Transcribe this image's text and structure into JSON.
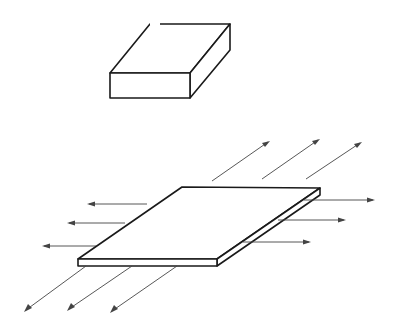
{
  "diagram": {
    "colors": {
      "line": "#1a1a1a",
      "arrow": "#444444",
      "background": "#ffffff"
    },
    "block": {
      "label": "thick-block",
      "front_face": [
        [
          110,
          73
        ],
        [
          190,
          73
        ],
        [
          190,
          98
        ],
        [
          110,
          98
        ]
      ],
      "top_face": [
        [
          110,
          73
        ],
        [
          150,
          24
        ],
        [
          230,
          24
        ],
        [
          190,
          73
        ]
      ],
      "side_face": [
        [
          190,
          73
        ],
        [
          230,
          24
        ],
        [
          230,
          50
        ],
        [
          190,
          98
        ]
      ]
    },
    "plate": {
      "label": "thin-plate",
      "top_face": [
        [
          78,
          259
        ],
        [
          182,
          187
        ],
        [
          320,
          188
        ],
        [
          217,
          259
        ]
      ],
      "front_face": [
        [
          78,
          259
        ],
        [
          217,
          259
        ],
        [
          217,
          266
        ],
        [
          78,
          266
        ]
      ],
      "side_face": [
        [
          217,
          259
        ],
        [
          320,
          188
        ],
        [
          320,
          195
        ],
        [
          217,
          266
        ]
      ]
    },
    "arrows": {
      "back_right": [
        {
          "from": [
            212,
            181
          ],
          "to": [
            270,
            141
          ]
        },
        {
          "from": [
            262,
            179
          ],
          "to": [
            320,
            139
          ]
        },
        {
          "from": [
            306,
            179
          ],
          "to": [
            362,
            142
          ]
        }
      ],
      "right": [
        {
          "from": [
            304,
            200
          ],
          "to": [
            375,
            200
          ]
        },
        {
          "from": [
            278,
            220
          ],
          "to": [
            346,
            220
          ]
        },
        {
          "from": [
            243,
            242
          ],
          "to": [
            311,
            242
          ]
        }
      ],
      "left": [
        {
          "from": [
            147,
            204
          ],
          "to": [
            87,
            204
          ]
        },
        {
          "from": [
            125,
            223
          ],
          "to": [
            67,
            223
          ]
        },
        {
          "from": [
            96,
            246
          ],
          "to": [
            42,
            246
          ]
        }
      ],
      "front_left": [
        {
          "from": [
            86,
            266
          ],
          "to": [
            24,
            312
          ]
        },
        {
          "from": [
            132,
            266
          ],
          "to": [
            67,
            311
          ]
        },
        {
          "from": [
            177,
            266
          ],
          "to": [
            110,
            313
          ]
        }
      ]
    }
  }
}
